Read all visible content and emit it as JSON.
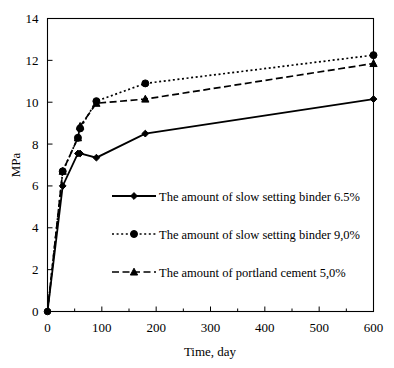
{
  "chart_data": {
    "type": "line",
    "title": "",
    "xlabel": "Time, day",
    "ylabel": "MPa",
    "xlim": [
      0,
      600
    ],
    "ylim": [
      0,
      14
    ],
    "xticks": [
      0,
      100,
      200,
      300,
      400,
      500,
      600
    ],
    "xtick_labels": [
      "0",
      "100",
      "200",
      "300",
      "400",
      "500",
      "600"
    ],
    "x_minor_ticks": [
      50,
      150,
      250,
      350,
      450,
      550
    ],
    "yticks": [
      0,
      2,
      4,
      6,
      8,
      10,
      12,
      14
    ],
    "ytick_labels": [
      "0",
      "2",
      "4",
      "6",
      "8",
      "10",
      "12",
      "14"
    ],
    "grid": false,
    "legend_position": "center-left-inside",
    "series": [
      {
        "name": "The amount of slow setting binder 6.5%",
        "line_style": "solid",
        "marker": "diamond",
        "color": "#000000",
        "x": [
          0,
          28,
          56,
          60,
          90,
          180,
          600
        ],
        "y": [
          0,
          6.0,
          7.55,
          7.55,
          7.35,
          8.5,
          10.15
        ]
      },
      {
        "name": "The amount of slow setting binder 9,0%",
        "line_style": "dotted",
        "marker": "circle",
        "color": "#000000",
        "x": [
          0,
          28,
          56,
          60,
          90,
          180,
          600
        ],
        "y": [
          0,
          6.7,
          8.3,
          8.75,
          10.05,
          10.9,
          12.25
        ]
      },
      {
        "name": "The amount of portland cement 5,0%",
        "line_style": "dashed",
        "marker": "triangle",
        "color": "#000000",
        "x": [
          0,
          28,
          56,
          60,
          90,
          180,
          600
        ],
        "y": [
          0,
          6.7,
          8.3,
          8.85,
          9.95,
          10.15,
          11.85
        ]
      }
    ]
  },
  "legend": {
    "entries": [
      {
        "label": "The amount of slow setting binder 6.5%",
        "marker": "diamond-marker",
        "line_style": "solid"
      },
      {
        "label": "The amount of slow setting binder 9,0%",
        "marker": "circle-marker",
        "line_style": "dotted"
      },
      {
        "label": "The amount of portland cement 5,0%",
        "marker": "triangle-marker",
        "line_style": "dashed"
      }
    ]
  },
  "axes": {
    "x_title": "Time, day",
    "y_title": "MPa"
  }
}
